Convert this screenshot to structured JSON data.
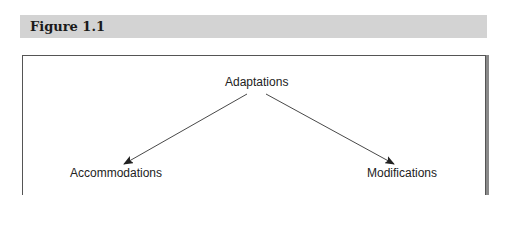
{
  "figure": {
    "title": "Figure 1.1"
  },
  "diagram": {
    "root": {
      "label": "Adaptations"
    },
    "children": [
      {
        "label": "Accommodations"
      },
      {
        "label": "Modifications"
      }
    ],
    "colors": {
      "header_bg": "#d3d3d3",
      "line": "#333333",
      "box_border": "#555555"
    }
  }
}
